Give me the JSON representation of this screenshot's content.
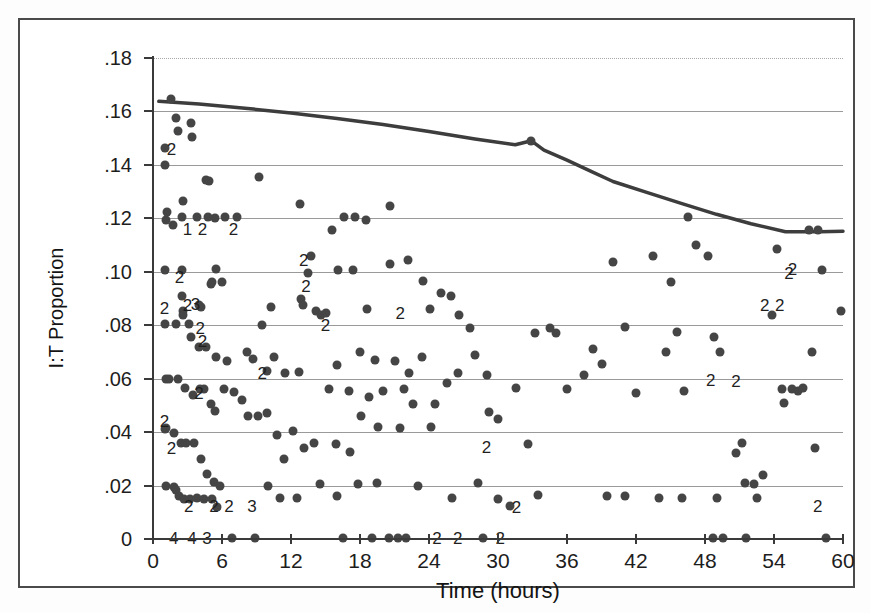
{
  "chart_data": {
    "type": "scatter",
    "title": "",
    "xlabel": "Time (hours)",
    "ylabel": "I:T Proportion",
    "xlim": [
      0,
      60
    ],
    "ylim": [
      0,
      0.18
    ],
    "grid": true,
    "legend": null,
    "xticks": [
      0,
      6,
      12,
      18,
      24,
      30,
      36,
      42,
      48,
      54,
      60
    ],
    "xticklabels": [
      "0",
      "6",
      "12",
      "18",
      "24",
      "30",
      "36",
      "42",
      "48",
      "54",
      "60"
    ],
    "yticks": [
      0,
      0.02,
      0.04,
      0.06,
      0.08,
      0.1,
      0.12,
      0.14,
      0.16,
      0.18
    ],
    "yticklabels": [
      "0",
      ".02",
      ".04",
      ".06",
      ".08",
      ".10",
      ".12",
      ".14",
      ".16",
      ".18"
    ],
    "series": [
      {
        "name": "I:T proportion observations",
        "marker": "filled-circle",
        "color": "#454545",
        "points": [
          [
            1.6,
            0.1645
          ],
          [
            2.0,
            0.1575
          ],
          [
            2.2,
            0.1525
          ],
          [
            3.3,
            0.1555
          ],
          [
            3.4,
            0.1505
          ],
          [
            1.0,
            0.1465
          ],
          [
            1.0,
            0.14
          ],
          [
            4.6,
            0.1345
          ],
          [
            4.9,
            0.134
          ],
          [
            9.2,
            0.1355
          ],
          [
            1.1,
            0.1195
          ],
          [
            2.6,
            0.1265
          ],
          [
            2.5,
            0.1205
          ],
          [
            1.2,
            0.1225
          ],
          [
            1.7,
            0.1175
          ],
          [
            3.8,
            0.1205
          ],
          [
            4.8,
            0.1205
          ],
          [
            5.4,
            0.12
          ],
          [
            6.3,
            0.1205
          ],
          [
            7.3,
            0.1205
          ],
          [
            12.8,
            0.1255
          ],
          [
            15.6,
            0.1155
          ],
          [
            16.6,
            0.1205
          ],
          [
            17.6,
            0.1205
          ],
          [
            18.5,
            0.1195
          ],
          [
            1.0,
            0.1005
          ],
          [
            2.5,
            0.1005
          ],
          [
            5.5,
            0.101
          ],
          [
            13.7,
            0.106
          ],
          [
            13.5,
            0.0995
          ],
          [
            16.1,
            0.1005
          ],
          [
            17.4,
            0.1005
          ],
          [
            20.6,
            0.103
          ],
          [
            22.2,
            0.1045
          ],
          [
            23.5,
            0.0965
          ],
          [
            2.5,
            0.091
          ],
          [
            2.6,
            0.0855
          ],
          [
            4.0,
            0.0875
          ],
          [
            4.2,
            0.087
          ],
          [
            5.0,
            0.0955
          ],
          [
            5.1,
            0.096
          ],
          [
            6.0,
            0.096
          ],
          [
            9.5,
            0.08
          ],
          [
            10.3,
            0.087
          ],
          [
            12.9,
            0.09
          ],
          [
            13.0,
            0.0875
          ],
          [
            14.2,
            0.0855
          ],
          [
            14.6,
            0.084
          ],
          [
            15.0,
            0.0845
          ],
          [
            18.6,
            0.086
          ],
          [
            1.0,
            0.0805
          ],
          [
            2.0,
            0.0805
          ],
          [
            2.6,
            0.084
          ],
          [
            3.1,
            0.0805
          ],
          [
            3.3,
            0.0755
          ],
          [
            4.0,
            0.072
          ],
          [
            4.6,
            0.072
          ],
          [
            5.5,
            0.068
          ],
          [
            6.4,
            0.0665
          ],
          [
            8.2,
            0.07
          ],
          [
            8.7,
            0.0675
          ],
          [
            9.9,
            0.063
          ],
          [
            10.5,
            0.068
          ],
          [
            11.5,
            0.062
          ],
          [
            12.7,
            0.0625
          ],
          [
            1.1,
            0.06
          ],
          [
            1.4,
            0.06
          ],
          [
            2.2,
            0.06
          ],
          [
            2.8,
            0.0565
          ],
          [
            3.5,
            0.054
          ],
          [
            4.1,
            0.056
          ],
          [
            4.4,
            0.056
          ],
          [
            5.0,
            0.0505
          ],
          [
            5.4,
            0.048
          ],
          [
            6.2,
            0.056
          ],
          [
            7.0,
            0.055
          ],
          [
            7.7,
            0.052
          ],
          [
            8.3,
            0.046
          ],
          [
            9.1,
            0.046
          ],
          [
            9.9,
            0.047
          ],
          [
            1.0,
            0.041
          ],
          [
            1.1,
            0.0415
          ],
          [
            1.8,
            0.0395
          ],
          [
            2.4,
            0.036
          ],
          [
            2.9,
            0.036
          ],
          [
            3.6,
            0.036
          ],
          [
            4.2,
            0.03
          ],
          [
            4.7,
            0.0245
          ],
          [
            5.3,
            0.0215
          ],
          [
            5.8,
            0.02
          ],
          [
            1.1,
            0.02
          ],
          [
            1.8,
            0.0195
          ],
          [
            2.0,
            0.0185
          ],
          [
            2.3,
            0.016
          ],
          [
            2.7,
            0.015
          ],
          [
            3.2,
            0.015
          ],
          [
            3.8,
            0.0155
          ],
          [
            4.4,
            0.015
          ],
          [
            5.1,
            0.015
          ],
          [
            5.6,
            0.012
          ],
          [
            6.9,
            0.0005
          ],
          [
            8.9,
            0.0005
          ],
          [
            16.5,
            0.0005
          ],
          [
            19.0,
            0.0005
          ],
          [
            20.5,
            0.0005
          ],
          [
            21.3,
            0.0005
          ],
          [
            22.0,
            0.0005
          ],
          [
            28.7,
            0.0005
          ],
          [
            48.7,
            0.0005
          ],
          [
            49.6,
            0.0005
          ],
          [
            51.6,
            0.0005
          ],
          [
            58.5,
            0.0005
          ],
          [
            20.6,
            0.1245
          ],
          [
            24.1,
            0.086
          ],
          [
            25.0,
            0.092
          ],
          [
            25.9,
            0.091
          ],
          [
            26.6,
            0.084
          ],
          [
            27.6,
            0.079
          ],
          [
            28.0,
            0.069
          ],
          [
            29.0,
            0.0615
          ],
          [
            29.2,
            0.0475
          ],
          [
            30.0,
            0.045
          ],
          [
            31.6,
            0.0565
          ],
          [
            32.6,
            0.0355
          ],
          [
            32.9,
            0.149
          ],
          [
            33.2,
            0.077
          ],
          [
            34.5,
            0.079
          ],
          [
            35.0,
            0.077
          ],
          [
            36.0,
            0.056
          ],
          [
            37.5,
            0.0615
          ],
          [
            38.3,
            0.071
          ],
          [
            39.0,
            0.0655
          ],
          [
            40.0,
            0.1035
          ],
          [
            41.0,
            0.0795
          ],
          [
            42.0,
            0.0545
          ],
          [
            43.5,
            0.106
          ],
          [
            44.6,
            0.07
          ],
          [
            45.0,
            0.096
          ],
          [
            45.6,
            0.0775
          ],
          [
            46.2,
            0.0555
          ],
          [
            46.5,
            0.1205
          ],
          [
            47.2,
            0.11
          ],
          [
            48.3,
            0.106
          ],
          [
            48.8,
            0.0755
          ],
          [
            49.3,
            0.07
          ],
          [
            50.7,
            0.032
          ],
          [
            51.2,
            0.036
          ],
          [
            51.5,
            0.021
          ],
          [
            52.3,
            0.0205
          ],
          [
            52.5,
            0.0155
          ],
          [
            53.0,
            0.024
          ],
          [
            53.8,
            0.084
          ],
          [
            54.3,
            0.1085
          ],
          [
            54.7,
            0.056
          ],
          [
            54.9,
            0.051
          ],
          [
            55.6,
            0.056
          ],
          [
            56.1,
            0.0555
          ],
          [
            56.5,
            0.0565
          ],
          [
            57.0,
            0.1155
          ],
          [
            57.3,
            0.07
          ],
          [
            57.6,
            0.034
          ],
          [
            57.8,
            0.1155
          ],
          [
            58.2,
            0.1005
          ],
          [
            59.8,
            0.0855
          ],
          [
            25.6,
            0.0585
          ],
          [
            24.2,
            0.042
          ],
          [
            21.5,
            0.0415
          ],
          [
            19.6,
            0.042
          ],
          [
            18.1,
            0.046
          ],
          [
            17.1,
            0.0325
          ],
          [
            15.9,
            0.0355
          ],
          [
            14.0,
            0.036
          ],
          [
            13.1,
            0.034
          ],
          [
            11.4,
            0.03
          ],
          [
            10.8,
            0.039
          ],
          [
            12.2,
            0.0405
          ],
          [
            10.0,
            0.02
          ],
          [
            11.0,
            0.0155
          ],
          [
            12.5,
            0.0155
          ],
          [
            14.5,
            0.0205
          ],
          [
            16.0,
            0.016
          ],
          [
            17.8,
            0.0205
          ],
          [
            19.5,
            0.021
          ],
          [
            23.0,
            0.02
          ],
          [
            26.0,
            0.0155
          ],
          [
            28.3,
            0.021
          ],
          [
            30.0,
            0.015
          ],
          [
            31.0,
            0.0125
          ],
          [
            33.5,
            0.0165
          ],
          [
            39.5,
            0.016
          ],
          [
            41.0,
            0.016
          ],
          [
            44.0,
            0.0155
          ],
          [
            46.0,
            0.0155
          ],
          [
            49.0,
            0.0155
          ],
          [
            16.0,
            0.065
          ],
          [
            18.0,
            0.07
          ],
          [
            19.3,
            0.067
          ],
          [
            21.0,
            0.0665
          ],
          [
            22.3,
            0.062
          ],
          [
            23.4,
            0.068
          ],
          [
            26.5,
            0.062
          ],
          [
            20.0,
            0.0555
          ],
          [
            18.8,
            0.053
          ],
          [
            17.0,
            0.0555
          ],
          [
            15.3,
            0.056
          ],
          [
            21.8,
            0.056
          ],
          [
            22.6,
            0.0505
          ],
          [
            24.5,
            0.0505
          ]
        ]
      }
    ],
    "overplot_labels": [
      {
        "x": 1.6,
        "y": 0.146,
        "text": "2"
      },
      {
        "x": 3.0,
        "y": 0.116,
        "text": "1"
      },
      {
        "x": 4.3,
        "y": 0.116,
        "text": "2"
      },
      {
        "x": 7.0,
        "y": 0.116,
        "text": "2"
      },
      {
        "x": 2.3,
        "y": 0.098,
        "text": "2"
      },
      {
        "x": 13.1,
        "y": 0.1045,
        "text": "2"
      },
      {
        "x": 13.3,
        "y": 0.0945,
        "text": "2"
      },
      {
        "x": 1.0,
        "y": 0.0865,
        "text": "2"
      },
      {
        "x": 3.0,
        "y": 0.0875,
        "text": "2"
      },
      {
        "x": 3.7,
        "y": 0.088,
        "text": "3"
      },
      {
        "x": 4.1,
        "y": 0.079,
        "text": "2"
      },
      {
        "x": 4.3,
        "y": 0.074,
        "text": "2"
      },
      {
        "x": 15.0,
        "y": 0.08,
        "text": "2"
      },
      {
        "x": 21.5,
        "y": 0.0845,
        "text": "2"
      },
      {
        "x": 9.5,
        "y": 0.062,
        "text": "2"
      },
      {
        "x": 48.5,
        "y": 0.0595,
        "text": "2"
      },
      {
        "x": 50.7,
        "y": 0.059,
        "text": "2"
      },
      {
        "x": 1.0,
        "y": 0.044,
        "text": "2"
      },
      {
        "x": 1.6,
        "y": 0.034,
        "text": "2"
      },
      {
        "x": 4.0,
        "y": 0.0545,
        "text": "2"
      },
      {
        "x": 29.0,
        "y": 0.0345,
        "text": "2"
      },
      {
        "x": 3.1,
        "y": 0.0125,
        "text": "2"
      },
      {
        "x": 5.3,
        "y": 0.0125,
        "text": "2"
      },
      {
        "x": 6.6,
        "y": 0.0125,
        "text": "2"
      },
      {
        "x": 8.6,
        "y": 0.0125,
        "text": "3"
      },
      {
        "x": 31.6,
        "y": 0.012,
        "text": "2"
      },
      {
        "x": 57.8,
        "y": 0.0125,
        "text": "2"
      },
      {
        "x": 1.8,
        "y": 0.0005,
        "text": "4"
      },
      {
        "x": 3.4,
        "y": 0.0005,
        "text": "4"
      },
      {
        "x": 4.7,
        "y": 0.0005,
        "text": "3"
      },
      {
        "x": 24.7,
        "y": 0.0005,
        "text": "2"
      },
      {
        "x": 26.5,
        "y": 0.0005,
        "text": "2"
      },
      {
        "x": 30.2,
        "y": 0.0005,
        "text": "2"
      },
      {
        "x": 55.3,
        "y": 0.0995,
        "text": "2"
      },
      {
        "x": 53.2,
        "y": 0.0875,
        "text": "2"
      },
      {
        "x": 54.5,
        "y": 0.0875,
        "text": "2"
      },
      {
        "x": 55.6,
        "y": 0.101,
        "text": "2"
      }
    ],
    "trendline": {
      "name": "smoothed trend",
      "color": "#3d3d3d",
      "width": 3.5,
      "points": [
        [
          0.5,
          0.1638
        ],
        [
          4,
          0.1628
        ],
        [
          8,
          0.1612
        ],
        [
          12,
          0.1594
        ],
        [
          16,
          0.1574
        ],
        [
          20,
          0.1551
        ],
        [
          24,
          0.1525
        ],
        [
          28,
          0.1497
        ],
        [
          31.5,
          0.1475
        ],
        [
          32.9,
          0.149
        ],
        [
          34,
          0.1455
        ],
        [
          36,
          0.1418
        ],
        [
          38,
          0.1378
        ],
        [
          40,
          0.1338
        ],
        [
          43,
          0.1296
        ],
        [
          46,
          0.1255
        ],
        [
          49,
          0.1215
        ],
        [
          52,
          0.118
        ],
        [
          55,
          0.115
        ],
        [
          58,
          0.115
        ],
        [
          60,
          0.1152
        ]
      ]
    }
  }
}
